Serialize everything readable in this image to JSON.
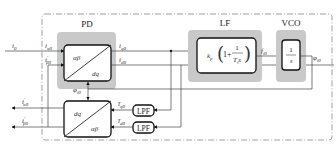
{
  "diagram": {
    "blocks": {
      "pd": {
        "label": "PD",
        "transform_top": "αβ",
        "transform_bottom": "dq"
      },
      "lf": {
        "label": "LF",
        "gain": "k",
        "gain_sub": "p",
        "paren_open": "(",
        "one_plus": "1+",
        "num": "1",
        "den_T": "T",
        "den_sub": "i",
        "den_s": "s",
        "paren_close": ")"
      },
      "vco": {
        "label": "VCO",
        "num": "1",
        "den": "s"
      },
      "inverse_transform": {
        "top": "dq",
        "bottom": "αβ"
      },
      "lpf_q": {
        "label": "LPF"
      },
      "lpf_d": {
        "label": "LPF"
      }
    },
    "signals": {
      "i0": {
        "main": "i",
        "sub": "0"
      },
      "i_alpha0": {
        "main": "i",
        "sub": "α0"
      },
      "i_beta0_prime": {
        "main": "i",
        "prime": "′",
        "sub": "β0"
      },
      "i_q0": {
        "main": "i",
        "sub": "q0"
      },
      "i_d0": {
        "main": "i",
        "sub": "d0"
      },
      "f_i0": {
        "main": "f",
        "sub": "i0"
      },
      "phi_i0_out": {
        "main": "φ",
        "sub": "i0"
      },
      "phi_i0_fb": {
        "main": "φ",
        "sub": "i0"
      },
      "i_q0_bar": {
        "main": "ī",
        "sub": "q0"
      },
      "i_d0_bar": {
        "main": "ī",
        "sub": "d0"
      },
      "i_alpha0_prime_out": {
        "main": "i",
        "prime": "′",
        "sub": "α0"
      },
      "i_beta0_prime_out": {
        "main": "i",
        "prime": "′",
        "sub": "β0"
      }
    },
    "colors": {
      "block_bg": "#c9c9c9",
      "stroke": "#111111",
      "wire": "#444444"
    }
  }
}
